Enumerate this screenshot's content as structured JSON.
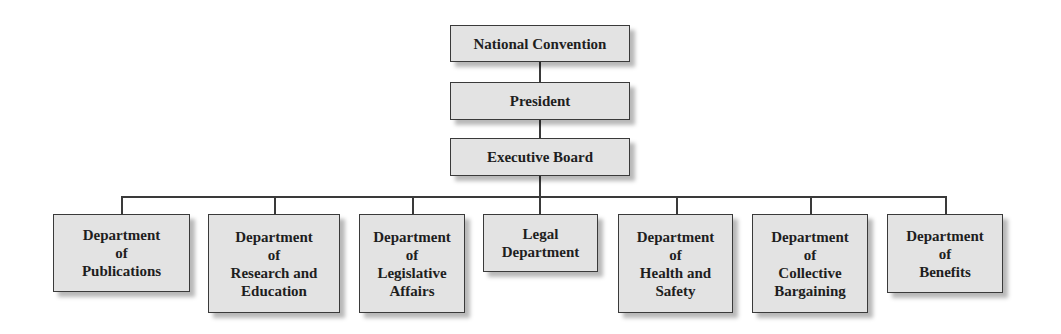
{
  "chart": {
    "type": "org-chart",
    "levels": {
      "top": "National Convention",
      "second": "President",
      "third": "Executive Board"
    },
    "departments": [
      {
        "label": "Department\nof\nPublications"
      },
      {
        "label": "Department\nof\nResearch and\nEducation"
      },
      {
        "label": "Department\nof\nLegislative\nAffairs"
      },
      {
        "label": "Legal\nDepartment"
      },
      {
        "label": "Department\nof\nHealth and\nSafety"
      },
      {
        "label": "Department\nof\nCollective\nBargaining"
      },
      {
        "label": "Department\nof\nBenefits"
      }
    ]
  },
  "colors": {
    "box_fill": "#e3e3e3",
    "border": "#3a3a3a",
    "text": "#1e1e1e"
  }
}
